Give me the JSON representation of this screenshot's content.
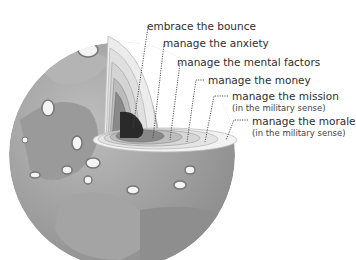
{
  "diagram": {
    "title": "",
    "layers": [
      {
        "id": "core",
        "label": "embrace the bounce",
        "subtitle": ""
      },
      {
        "id": "layer2",
        "label": "manage the anxiety",
        "subtitle": ""
      },
      {
        "id": "layer3",
        "label": "manage the mental factors",
        "subtitle": ""
      },
      {
        "id": "layer4",
        "label": "manage the money",
        "subtitle": ""
      },
      {
        "id": "layer5",
        "label": "manage the mission",
        "subtitle": "(in the military sense)"
      },
      {
        "id": "crust",
        "label": "manage the morale",
        "subtitle": "(in the military sense)"
      }
    ],
    "colors": {
      "sphere_dark": "#8a8a8a",
      "sphere_mid": "#a8a8a8",
      "sphere_light": "#c4c4c4",
      "ring_light": "#e8e8e8",
      "core": "#2a2a2a",
      "leader_line": "#444444"
    }
  }
}
